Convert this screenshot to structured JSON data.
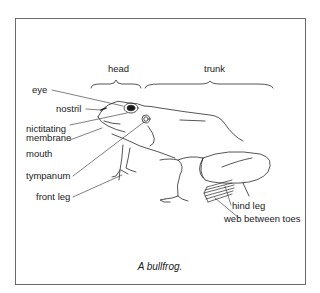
{
  "figure": {
    "caption": "A bullfrog.",
    "regions": {
      "head": "head",
      "trunk": "trunk"
    },
    "labels": {
      "eye": "eye",
      "nostril": "nostril",
      "nictitating_line1": "nictitating",
      "nictitating_line2": "membrane",
      "mouth": "mouth",
      "tympanum": "tympanum",
      "front_leg": "front leg",
      "hind_leg": "hind leg",
      "web_between_toes": "web between toes"
    },
    "colors": {
      "line": "#2a2a2a",
      "frame": "#6b6b6b",
      "background": "#ffffff"
    }
  }
}
